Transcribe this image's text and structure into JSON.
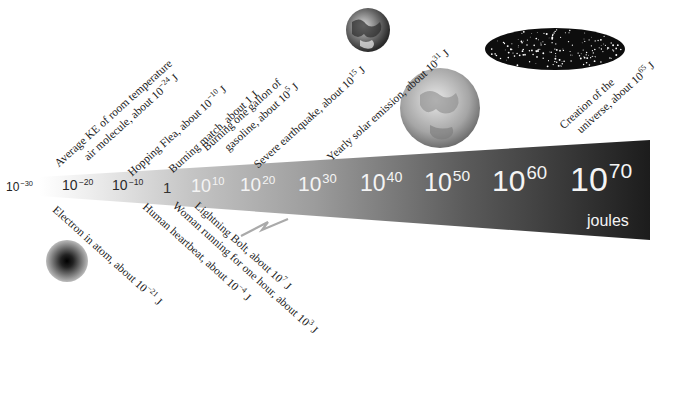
{
  "diagram": {
    "unit_label": "joules",
    "colors": {
      "wedge_light": "#f2f2f2",
      "wedge_mid": "#9a9a9a",
      "wedge_dark": "#1e1e1e",
      "text": "#1a1a1a"
    },
    "ticks": [
      {
        "base": "10",
        "exp": "−30"
      },
      {
        "base": "10",
        "exp": "−20"
      },
      {
        "base": "10",
        "exp": "−10"
      },
      {
        "base": "1",
        "exp": ""
      },
      {
        "base": "10",
        "exp": "10"
      },
      {
        "base": "10",
        "exp": "20"
      },
      {
        "base": "10",
        "exp": "30"
      },
      {
        "base": "10",
        "exp": "40"
      },
      {
        "base": "10",
        "exp": "50"
      },
      {
        "base": "10",
        "exp": "60"
      },
      {
        "base": "10",
        "exp": "70"
      }
    ],
    "labels_above": [
      {
        "line1": "Average KE of room temperature",
        "line2_pre": "air molecule, about 10",
        "exp": "−24",
        "unit": " J"
      },
      {
        "pre": "Hopping Flea, about 10",
        "exp": "−10",
        "unit": " J"
      },
      {
        "pre": "Burning match, about 1 J"
      },
      {
        "line1": "Burning one gallon of",
        "line2_pre": "gasoline, about 10",
        "exp": "5",
        "unit": " J"
      },
      {
        "pre": "Severe earthquake, about 10",
        "exp": "15",
        "unit": " J"
      },
      {
        "pre": "Yearly solar emission, about 10",
        "exp": "31",
        "unit": " J"
      },
      {
        "line1": "Creation of the",
        "line2_pre": "universe, about 10",
        "exp": "65",
        "unit": " J"
      }
    ],
    "labels_below": [
      {
        "pre": "Electron in atom, about 10",
        "exp": "−21",
        "unit": " J"
      },
      {
        "pre": "Human heartbeat, about 10",
        "exp": "−4",
        "unit": " J"
      },
      {
        "pre": "Woman running for one hour, about 10",
        "exp": "3",
        "unit": " J"
      },
      {
        "pre": "Lightning Bolt, about 10",
        "exp": "7",
        "unit": " J"
      }
    ],
    "icons": [
      "electron-icon",
      "lightning-bolt-icon",
      "earth-icon",
      "sun-icon",
      "universe-icon"
    ]
  }
}
